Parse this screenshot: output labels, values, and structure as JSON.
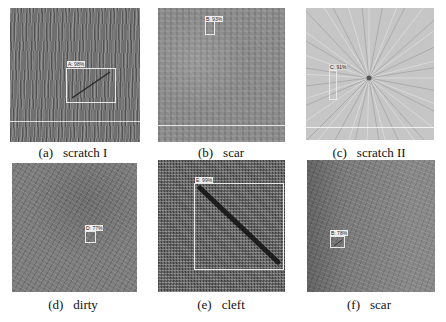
{
  "figure": {
    "panels": [
      {
        "tag": "(a)",
        "name": "scratch I",
        "detection": {
          "label": "A: 98%",
          "class": "A",
          "confidence": "98%"
        }
      },
      {
        "tag": "(b)",
        "name": "scar",
        "detection": {
          "label": "B: 93%",
          "class": "B",
          "confidence": "93%"
        }
      },
      {
        "tag": "(c)",
        "name": "scratch II",
        "detection": {
          "label": "C: 91%",
          "class": "C",
          "confidence": "91%"
        }
      },
      {
        "tag": "(d)",
        "name": "dirty",
        "detection": {
          "label": "D: 77%",
          "class": "D",
          "confidence": "77%"
        }
      },
      {
        "tag": "(e)",
        "name": "cleft",
        "detection": {
          "label": "E: 99%",
          "class": "E",
          "confidence": "99%"
        }
      },
      {
        "tag": "(f)",
        "name": "scar",
        "detection": {
          "label": "B: 78%",
          "class": "B",
          "confidence": "78%"
        }
      }
    ]
  }
}
